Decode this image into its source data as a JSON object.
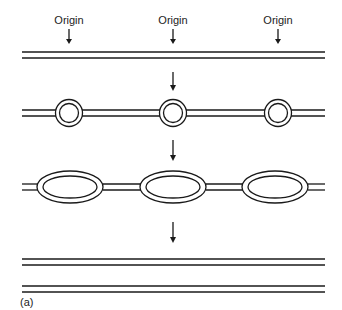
{
  "diagram": {
    "type": "DNA replication with multiple origins (schematic)",
    "caption": "(a)",
    "origin_labels": [
      {
        "text": "Origin",
        "x": 69
      },
      {
        "text": "Origin",
        "x": 173
      },
      {
        "text": "Origin",
        "x": 278
      }
    ],
    "stages": [
      {
        "name": "unreplicated DNA",
        "description": "parental double strand"
      },
      {
        "name": "replication bubbles",
        "description": "small bubbles form at each origin"
      },
      {
        "name": "expanded bubbles",
        "description": "bubbles grow bidirectionally"
      },
      {
        "name": "completed replication",
        "description": "two daughter double-stranded molecules"
      }
    ],
    "colors": {
      "line": "#1a1a1a",
      "background": "#ffffff"
    }
  }
}
